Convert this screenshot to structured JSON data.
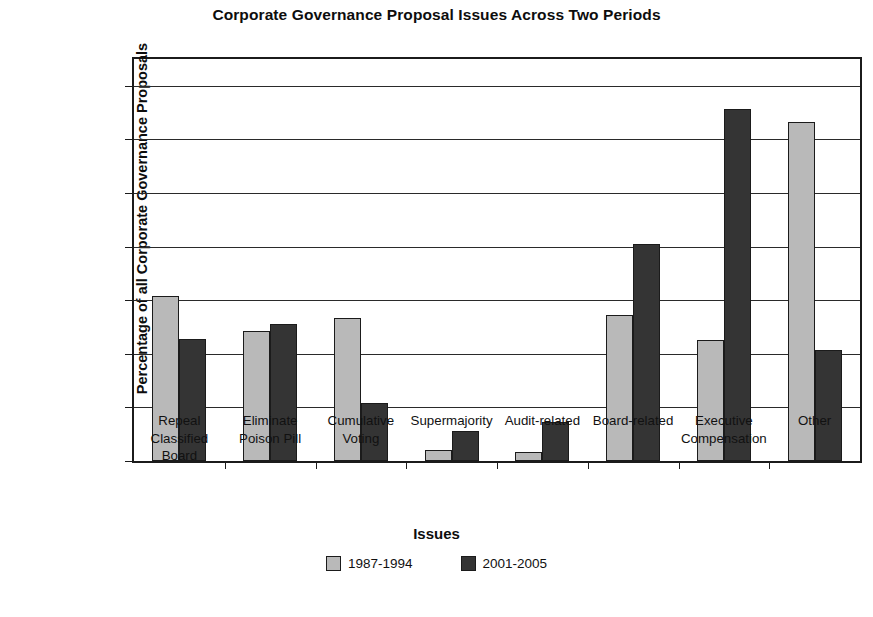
{
  "chart_data": {
    "type": "bar",
    "title": "Corporate Governance Proposal Issues Across Two Periods",
    "xlabel": "Issues",
    "ylabel": "Percentage of all Corporate Governance Proposals",
    "ylim": [
      0,
      37.5
    ],
    "ytick_values": [
      0,
      5,
      10,
      15,
      20,
      25,
      30,
      35
    ],
    "ytick_labels": [
      "0%",
      "5%",
      "10%",
      "15%",
      "20%",
      "25%",
      "30%",
      "35%"
    ],
    "grid": true,
    "legend_position": "bottom-center",
    "categories": [
      "Repeal Classified Board",
      "Eliminate Poison Pill",
      "Cumulative Voting",
      "Supermajority",
      "Audit-related",
      "Board-related",
      "Executive Compensation",
      "Other"
    ],
    "category_label_lines": [
      [
        "Repeal",
        "Classified",
        "Board"
      ],
      [
        "Eliminate",
        "Poison Pill"
      ],
      [
        "Cumulative",
        "Voting"
      ],
      [
        "Supermajority"
      ],
      [
        "Audit-related"
      ],
      [
        "Board-related"
      ],
      [
        "Executive",
        "Compensation"
      ],
      [
        "Other"
      ]
    ],
    "series": [
      {
        "name": "1987-1994",
        "color": "#b9b9b9",
        "values": [
          15.4,
          12.1,
          13.3,
          1.0,
          0.8,
          13.6,
          11.3,
          31.6
        ]
      },
      {
        "name": "2001-2005",
        "color": "#343434",
        "values": [
          11.4,
          12.8,
          5.4,
          2.8,
          3.6,
          20.2,
          32.8,
          10.4
        ]
      }
    ]
  },
  "legend": {
    "items": [
      {
        "label": "1987-1994",
        "color": "#b9b9b9"
      },
      {
        "label": "2001-2005",
        "color": "#343434"
      }
    ]
  },
  "colors": {
    "axis": "#1b1b1b",
    "grid": "#2a2a2a",
    "background": "#ffffff",
    "series_1987_1994": "#b9b9b9",
    "series_2001_2005": "#343434"
  }
}
